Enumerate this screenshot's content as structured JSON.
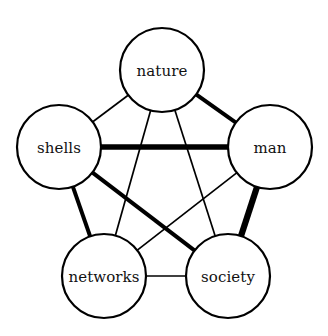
{
  "figure": {
    "title": "",
    "background_color": "#ffffff",
    "stroke_color": "#000000",
    "label_color": "#111111"
  },
  "chart_data": {
    "type": "diagram",
    "subtype": "weighted-network-graph",
    "title": "",
    "layout": "pentagon",
    "nodes": [
      {
        "id": "nature",
        "label": "nature",
        "cx": 162,
        "cy": 70,
        "r": 42,
        "border_width": 2.2
      },
      {
        "id": "man",
        "label": "man",
        "cx": 270,
        "cy": 147,
        "r": 42,
        "border_width": 2.2
      },
      {
        "id": "society",
        "label": "society",
        "cx": 228,
        "cy": 276,
        "r": 42,
        "border_width": 2.2
      },
      {
        "id": "networks",
        "label": "networks",
        "cx": 104,
        "cy": 276,
        "r": 42,
        "border_width": 2.2
      },
      {
        "id": "shells",
        "label": "shells",
        "cx": 59,
        "cy": 147,
        "r": 42,
        "border_width": 2.2
      }
    ],
    "edges": [
      {
        "source": "nature",
        "target": "man",
        "weight": 4.0
      },
      {
        "source": "nature",
        "target": "shells",
        "weight": 1.7
      },
      {
        "source": "nature",
        "target": "networks",
        "weight": 1.7
      },
      {
        "source": "nature",
        "target": "society",
        "weight": 1.7
      },
      {
        "source": "shells",
        "target": "man",
        "weight": 5.4
      },
      {
        "source": "shells",
        "target": "networks",
        "weight": 4.0
      },
      {
        "source": "shells",
        "target": "society",
        "weight": 4.0
      },
      {
        "source": "man",
        "target": "society",
        "weight": 6.2
      },
      {
        "source": "man",
        "target": "networks",
        "weight": 1.7
      },
      {
        "source": "networks",
        "target": "society",
        "weight": 1.7
      }
    ],
    "legend": [],
    "annotations": []
  }
}
